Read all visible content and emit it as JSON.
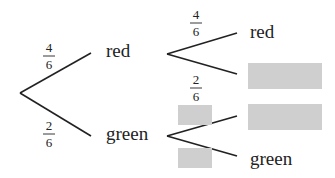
{
  "diagram": {
    "type": "probability-tree",
    "first_stage": {
      "branches": [
        {
          "outcome": "red",
          "prob_num": "4",
          "prob_den": "6"
        },
        {
          "outcome": "green",
          "prob_num": "2",
          "prob_den": "6"
        }
      ]
    },
    "second_stage_after_red": {
      "branches": [
        {
          "outcome": "red",
          "prob_num": "4",
          "prob_den": "6"
        },
        {
          "outcome": "[hidden]",
          "prob_num": "2",
          "prob_den": "6"
        }
      ]
    },
    "second_stage_after_green": {
      "branches": [
        {
          "outcome": "[hidden]",
          "prob": "[hidden]"
        },
        {
          "outcome": "green",
          "prob": "[hidden]"
        }
      ]
    },
    "colors": {
      "line": "#222222",
      "mask": "#cfcfcf"
    }
  }
}
